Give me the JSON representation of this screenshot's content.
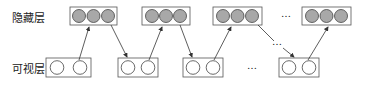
{
  "labels": {
    "hidden_layer": "隐藏层",
    "visible_layer": "可视层"
  },
  "colors": {
    "hidden_unit_fill": "#a8a8a8",
    "visible_unit_fill": "#ffffff",
    "stroke": "#444444"
  },
  "ellipsis": "…",
  "hidden_groups": [
    {
      "units": 3
    },
    {
      "units": 3
    },
    {
      "units": 3
    },
    {
      "units": 3
    }
  ],
  "visible_groups": [
    {
      "units": 2
    },
    {
      "units": 2
    },
    {
      "units": 2
    },
    {
      "units": 2
    }
  ]
}
